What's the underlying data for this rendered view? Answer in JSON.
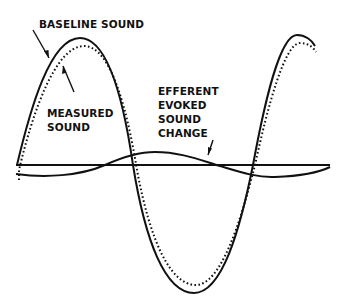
{
  "diagram": {
    "type": "waveform-illustration",
    "labels": {
      "baseline_sound": "BASELINE SOUND",
      "measured_sound_line1": "MEASURED",
      "measured_sound_line2": "SOUND",
      "efferent_line1": "EFFERENT",
      "efferent_line2": "EVOKED",
      "efferent_line3": "SOUND",
      "efferent_line4": "CHANGE"
    },
    "series": [
      {
        "name": "Baseline sound",
        "style": "solid",
        "color": "#111111"
      },
      {
        "name": "Measured sound",
        "style": "dotted",
        "color": "#111111"
      },
      {
        "name": "Efferent evoked sound change",
        "style": "solid",
        "color": "#111111"
      },
      {
        "name": "Zero axis",
        "style": "solid",
        "color": "#111111"
      }
    ]
  }
}
